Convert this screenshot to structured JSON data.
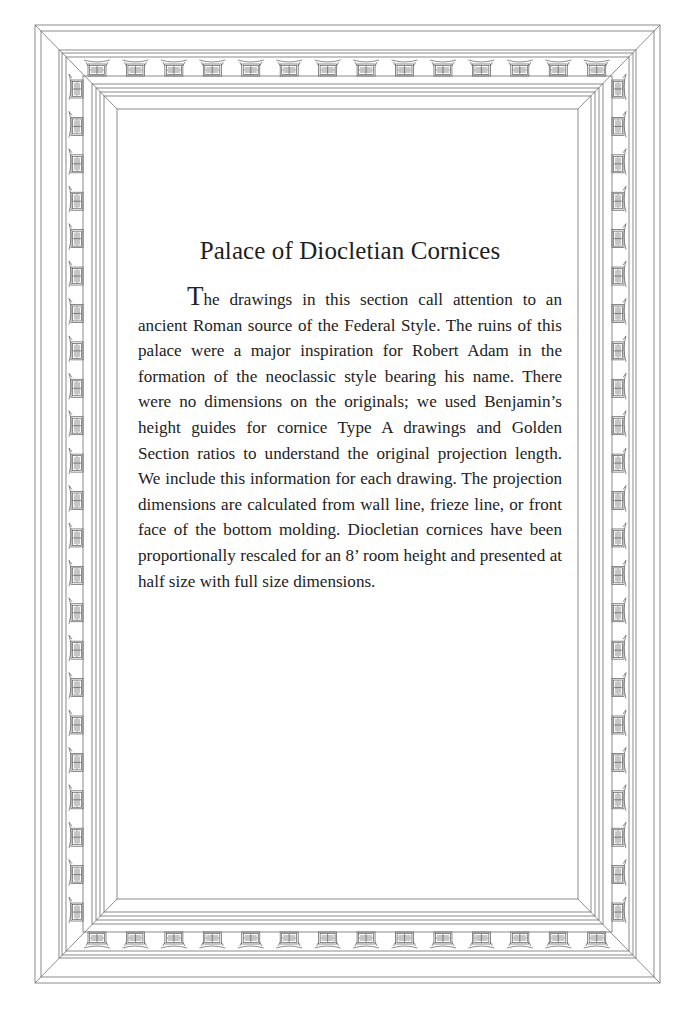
{
  "page": {
    "title": "Palace of Diocletian Cornices",
    "body_first_letter": "T",
    "body_rest": "he drawings in this section call attention to an ancient Roman source of the Federal Style.  The ruins of this palace were a major inspiration for Robert Adam in the formation of the neoclassic style bearing his name.  There were no dimensions on the originals; we used Benjamin’s height guides for cornice Type A drawings and Golden Section ratios to understand the original projection length.  We include this information for each drawing.  The projection dimensions are calculated from wall line, frieze line, or front face of the bottom molding.  Diocletian cornices have been proportionally rescaled for an 8’ room height and presented at half size with full size dimensions."
  },
  "frame": {
    "style": "ornamental-cornice-border",
    "line_color": "#6e6e6e",
    "background": "#ffffff",
    "ornament_blocks_horizontal": 14,
    "ornament_blocks_vertical": 23
  }
}
